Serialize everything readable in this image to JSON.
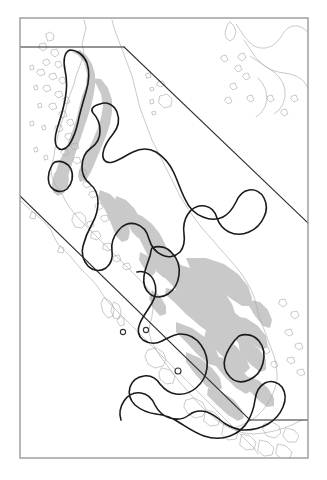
{
  "figure": {
    "kind": "distribution-range-map",
    "title": "",
    "caption": "",
    "region_label": "Malay Peninsula and adjacent Sundaland",
    "background_color": "#ffffff",
    "width": 327,
    "height": 480
  },
  "frame": {
    "name": "map-neatline",
    "stroke_color": "#9a9a9a",
    "stroke_width": 1.4,
    "x": 20,
    "y": 18,
    "width": 288,
    "height": 440
  },
  "layers": [
    {
      "id": "coastline",
      "label": "Coastline",
      "stroke_color": "#a6a6a6",
      "stroke_width": 0.6,
      "fill": "none"
    },
    {
      "id": "habitat",
      "label": "Shaded habitat / forest cover",
      "fill_color": "#c9c9c9",
      "stroke_color": "none",
      "opacity": 1
    },
    {
      "id": "range",
      "label": "Range boundary",
      "stroke_color": "#1a1a1a",
      "stroke_width": 1.6,
      "fill": "none"
    },
    {
      "id": "graticule",
      "label": "Clipping neatline / graticule",
      "stroke_color": "#2b2b2b",
      "stroke_width": 1.1
    },
    {
      "id": "localities",
      "label": "Locality records",
      "marker": "open-circle",
      "stroke_color": "#333333",
      "fill_color": "#ffffff",
      "radius": 2.6,
      "count": 3
    }
  ],
  "neatlines": [
    {
      "name": "upper-horizontal-cut",
      "x1": 20,
      "y1": 47,
      "x2": 124,
      "y2": 47
    },
    {
      "name": "upper-diagonal-cut",
      "x1": 124,
      "y1": 47,
      "x2": 308,
      "y2": 223
    },
    {
      "name": "lower-diagonal-cut",
      "x1": 20,
      "y1": 196,
      "x2": 250,
      "y2": 420
    },
    {
      "name": "lower-horizontal-cut",
      "x1": 250,
      "y1": 420,
      "x2": 308,
      "y2": 420
    }
  ],
  "localities": [
    {
      "name": "locality-1",
      "x": 123,
      "y": 332
    },
    {
      "name": "locality-2",
      "x": 146,
      "y": 330
    },
    {
      "name": "locality-3",
      "x": 178,
      "y": 371
    }
  ],
  "range_polygons": [
    {
      "name": "range-north-tenasserim"
    },
    {
      "name": "range-isthmus"
    },
    {
      "name": "range-central-peninsula"
    },
    {
      "name": "range-south-peninsula"
    },
    {
      "name": "range-langkawi-islet"
    }
  ]
}
